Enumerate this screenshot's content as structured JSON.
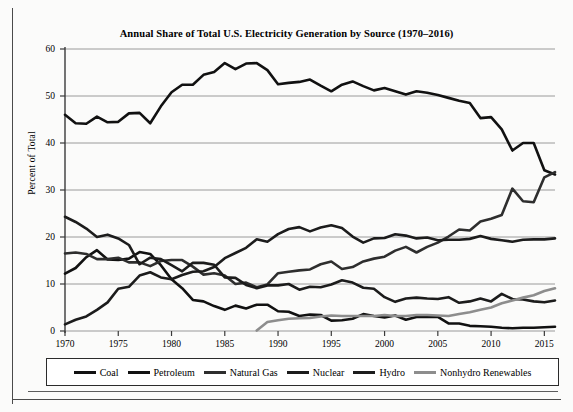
{
  "chart_data": {
    "type": "line",
    "title": "Annual Share of Total U.S. Electricity Generation by Source (1970–2016)",
    "xlabel": "",
    "ylabel": "Percent of Total",
    "xlim": [
      1970,
      2016
    ],
    "ylim": [
      0,
      60
    ],
    "grid": "horizontal",
    "legend_position": "bottom",
    "x_ticks": [
      "1970",
      "1975",
      "1980",
      "1985",
      "1990",
      "1995",
      "2000",
      "2005",
      "2010",
      "2015"
    ],
    "x_tick_values": [
      1970,
      1975,
      1980,
      1985,
      1990,
      1995,
      2000,
      2005,
      2010,
      2015
    ],
    "y_ticks": [
      "0",
      "10",
      "20",
      "30",
      "40",
      "50",
      "60"
    ],
    "y_tick_values": [
      0,
      10,
      20,
      30,
      40,
      50,
      60
    ],
    "x": [
      1970,
      1971,
      1972,
      1973,
      1974,
      1975,
      1976,
      1977,
      1978,
      1979,
      1980,
      1981,
      1982,
      1983,
      1984,
      1985,
      1986,
      1987,
      1988,
      1989,
      1990,
      1991,
      1992,
      1993,
      1994,
      1995,
      1996,
      1997,
      1998,
      1999,
      2000,
      2001,
      2002,
      2003,
      2004,
      2005,
      2006,
      2007,
      2008,
      2009,
      2010,
      2011,
      2012,
      2013,
      2014,
      2015,
      2016
    ],
    "series": [
      {
        "name": "Coal",
        "color": "#111111",
        "width": 2.6,
        "values": [
          46.0,
          44.2,
          44.1,
          45.6,
          44.4,
          44.5,
          46.3,
          46.4,
          44.2,
          47.8,
          50.8,
          52.4,
          52.4,
          54.5,
          55.1,
          57.0,
          55.7,
          56.9,
          57.0,
          55.5,
          52.5,
          52.8,
          53.0,
          53.5,
          52.2,
          51.0,
          52.4,
          53.1,
          52.1,
          51.2,
          51.7,
          51.0,
          50.3,
          51.0,
          50.7,
          50.2,
          49.6,
          49.0,
          48.5,
          45.3,
          45.5,
          42.9,
          38.4,
          40.0,
          40.0,
          34.2,
          33.3
        ]
      },
      {
        "name": "Petroleum",
        "color": "#111111",
        "width": 2.6,
        "values": [
          12.2,
          13.4,
          15.7,
          17.2,
          15.2,
          15.1,
          15.4,
          16.8,
          16.4,
          14.0,
          11.0,
          9.1,
          6.6,
          6.3,
          5.3,
          4.5,
          5.4,
          4.8,
          5.6,
          5.6,
          4.2,
          4.1,
          3.2,
          3.5,
          3.4,
          2.2,
          2.3,
          2.6,
          3.6,
          3.2,
          2.9,
          3.3,
          2.4,
          3.0,
          3.0,
          3.0,
          1.6,
          1.6,
          1.1,
          1.0,
          0.9,
          0.7,
          0.6,
          0.7,
          0.7,
          0.8,
          0.9
        ]
      },
      {
        "name": "Natural Gas",
        "color": "#2e2e2e",
        "width": 2.6,
        "values": [
          16.5,
          16.7,
          16.4,
          15.3,
          15.3,
          15.6,
          14.6,
          14.6,
          13.8,
          14.9,
          15.1,
          15.1,
          13.7,
          12.0,
          12.3,
          11.8,
          10.0,
          10.3,
          9.3,
          9.9,
          12.3,
          12.6,
          12.9,
          13.1,
          14.2,
          14.8,
          13.2,
          13.6,
          14.8,
          15.4,
          15.8,
          17.1,
          17.9,
          16.7,
          17.9,
          18.8,
          20.1,
          21.6,
          21.4,
          23.3,
          23.9,
          24.7,
          30.3,
          27.6,
          27.4,
          32.7,
          33.8
        ]
      },
      {
        "name": "Nuclear",
        "color": "#1c1c1c",
        "width": 2.6,
        "values": [
          1.4,
          2.4,
          3.1,
          4.5,
          6.1,
          9.0,
          9.4,
          11.8,
          12.5,
          11.4,
          11.0,
          11.9,
          12.6,
          12.7,
          13.6,
          15.5,
          16.6,
          17.7,
          19.5,
          19.0,
          20.6,
          21.7,
          22.1,
          21.2,
          22.0,
          22.5,
          21.9,
          20.1,
          18.8,
          19.7,
          19.8,
          20.6,
          20.3,
          19.7,
          19.9,
          19.3,
          19.4,
          19.4,
          19.6,
          20.2,
          19.6,
          19.3,
          19.0,
          19.4,
          19.5,
          19.5,
          19.7
        ]
      },
      {
        "name": "Hydro",
        "color": "#1c1c1c",
        "width": 2.6,
        "values": [
          24.3,
          23.2,
          21.8,
          20.0,
          20.5,
          19.7,
          18.3,
          14.2,
          15.6,
          15.3,
          14.0,
          12.7,
          14.5,
          14.5,
          14.1,
          11.4,
          11.3,
          9.8,
          9.1,
          9.7,
          9.7,
          10.0,
          8.8,
          9.4,
          9.3,
          9.9,
          10.8,
          10.3,
          9.2,
          9.0,
          7.2,
          6.2,
          6.9,
          7.1,
          6.9,
          6.8,
          7.2,
          6.0,
          6.3,
          6.9,
          6.3,
          7.9,
          6.8,
          6.7,
          6.3,
          6.1,
          6.5
        ]
      },
      {
        "name": "Nonhydro Renewables",
        "color": "#8d8d8d",
        "width": 2.6,
        "values": [
          null,
          null,
          null,
          null,
          null,
          null,
          null,
          null,
          null,
          null,
          null,
          null,
          null,
          null,
          null,
          null,
          null,
          null,
          0.1,
          1.9,
          2.3,
          2.6,
          2.7,
          2.8,
          3.1,
          3.3,
          3.2,
          3.2,
          3.2,
          3.2,
          3.4,
          3.2,
          3.2,
          3.4,
          3.4,
          3.3,
          3.2,
          3.6,
          4.0,
          4.5,
          5.0,
          5.9,
          6.5,
          7.1,
          7.6,
          8.5,
          9.1
        ]
      }
    ]
  },
  "legend": {
    "items": [
      {
        "label": "Coal",
        "color": "#111111"
      },
      {
        "label": "Petroleum",
        "color": "#111111"
      },
      {
        "label": "Natural Gas",
        "color": "#2e2e2e"
      },
      {
        "label": "Nuclear",
        "color": "#1c1c1c"
      },
      {
        "label": "Hydro",
        "color": "#1c1c1c"
      },
      {
        "label": "Nonhydro Renewables",
        "color": "#8d8d8d"
      }
    ]
  },
  "axes": {
    "grid_color": "#9a9a9a",
    "axis_color": "#3a3a3a"
  }
}
